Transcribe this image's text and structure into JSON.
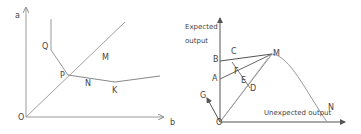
{
  "left_diagram": {
    "axis_y_label": "a",
    "axis_x_label": "b",
    "origin_label": "O",
    "points": {
      "Q": "Q",
      "P": "P",
      "M": "M",
      "N": "N",
      "K": "K"
    }
  },
  "right_diagram": {
    "axis_y_label_line1": "Expected",
    "axis_y_label_line2": "output",
    "axis_x_label": "Unexpected output",
    "origin_label": "O",
    "points": {
      "A": "A",
      "B": "B",
      "C": "C",
      "D": "D",
      "E": "E",
      "F": "F",
      "G": "G",
      "M": "M",
      "N": "N"
    }
  },
  "colors": {
    "line": "#9a9a9a",
    "dark_line": "#555555",
    "text": "#444444"
  }
}
